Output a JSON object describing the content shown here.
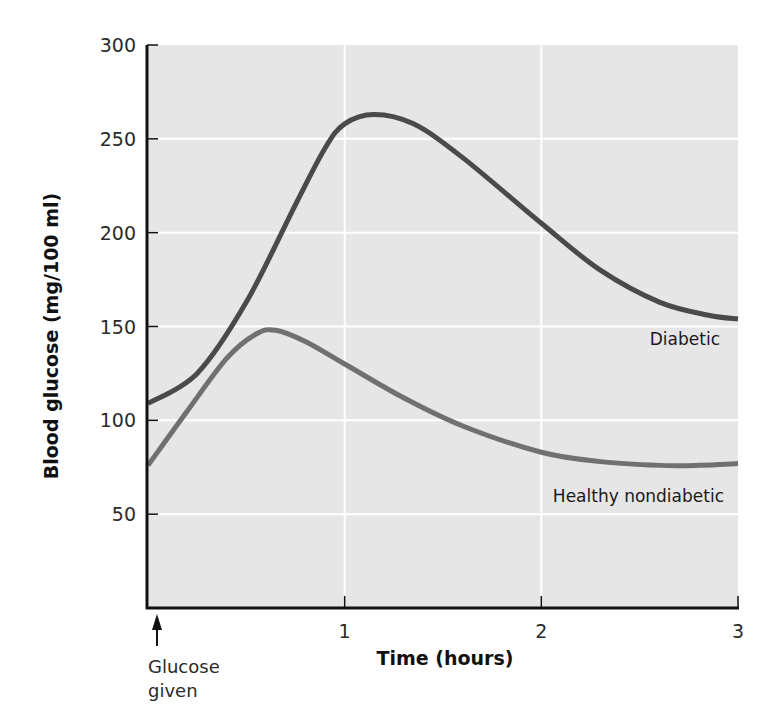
{
  "chart_data": {
    "type": "line",
    "title": "",
    "xlabel": "Time (hours)",
    "ylabel": "Blood glucose (mg/100 ml)",
    "xlim": [
      0,
      3
    ],
    "ylim": [
      0,
      300
    ],
    "x_ticks": [
      "1",
      "2",
      "3"
    ],
    "x_tick_values": [
      1,
      2,
      3
    ],
    "y_ticks": [
      "50",
      "100",
      "150",
      "200",
      "250",
      "300"
    ],
    "y_tick_values": [
      50,
      100,
      150,
      200,
      250,
      300
    ],
    "grid": true,
    "legend": "inline labels",
    "series": [
      {
        "name": "Diabetic",
        "color": "#4a4a4a",
        "x": [
          0,
          0.25,
          0.5,
          0.75,
          0.9,
          1.0,
          1.15,
          1.35,
          1.6,
          2.0,
          2.3,
          2.6,
          2.85,
          3.0
        ],
        "values": [
          109,
          125,
          163,
          215,
          245,
          258,
          263,
          258,
          240,
          205,
          180,
          163,
          156,
          154
        ]
      },
      {
        "name": "Healthy nondiabetic",
        "color": "#707070",
        "x": [
          0,
          0.2,
          0.4,
          0.55,
          0.65,
          0.8,
          1.0,
          1.3,
          1.6,
          2.0,
          2.3,
          2.6,
          2.8,
          3.0
        ],
        "values": [
          76,
          105,
          133,
          146,
          148,
          142,
          130,
          112,
          97,
          83,
          78,
          76,
          76,
          77
        ]
      }
    ],
    "annotations": [
      {
        "text": "Glucose given",
        "lines": [
          "Glucose",
          "given"
        ],
        "x": 0,
        "marker": "up-arrow"
      }
    ]
  },
  "colors": {
    "plot_background": "#e6e6e6",
    "grid": "#ffffff",
    "axis": "#111111"
  }
}
